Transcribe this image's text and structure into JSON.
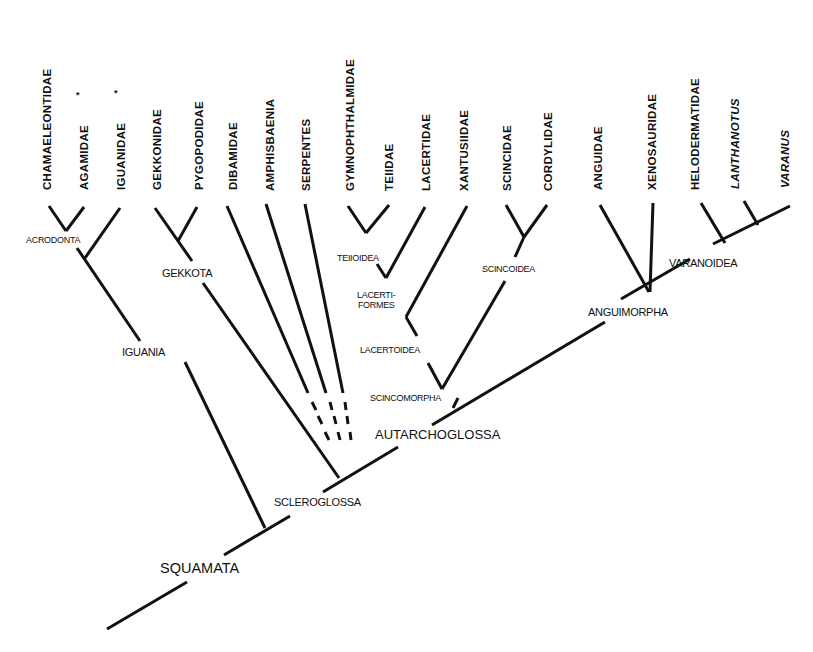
{
  "diagram": {
    "type": "cladogram",
    "root": "SQUAMATA",
    "taxa": [
      {
        "id": "chamaeleontidae",
        "label": "CHAMAELEONTIDAE",
        "x": 52,
        "italic": false,
        "marked": false
      },
      {
        "id": "agamidae",
        "label": "AGAMIDAE",
        "x": 89,
        "italic": false,
        "marked": true
      },
      {
        "id": "iguanidae",
        "label": "IGUANIDAE",
        "x": 125,
        "italic": false,
        "marked": true
      },
      {
        "id": "gekkonidae",
        "label": "GEKKONIDAE",
        "x": 162,
        "italic": false,
        "marked": false
      },
      {
        "id": "pygopodidae",
        "label": "PYGOPODIDAE",
        "x": 205,
        "italic": false,
        "marked": false
      },
      {
        "id": "dibamidae",
        "label": "DIBAMIDAE",
        "x": 238,
        "italic": false,
        "marked": false
      },
      {
        "id": "amphisbaenia",
        "label": "AMPHISBAENIA",
        "x": 277,
        "italic": false,
        "marked": false
      },
      {
        "id": "serpentes",
        "label": "SERPENTES",
        "x": 314,
        "italic": false,
        "marked": false
      },
      {
        "id": "gymnophthalmidae",
        "label": "GYMNOPHTHALMIDAE",
        "x": 358,
        "italic": false,
        "marked": false
      },
      {
        "id": "teiidae",
        "label": "TEIIDAE",
        "x": 396,
        "italic": false,
        "marked": false
      },
      {
        "id": "lacertidae",
        "label": "LACERTIDAE",
        "x": 432,
        "italic": false,
        "marked": false
      },
      {
        "id": "xantusiidae",
        "label": "XANTUSIIDAE",
        "x": 469,
        "italic": false,
        "marked": false
      },
      {
        "id": "scincidae",
        "label": "SCINCIDAE",
        "x": 512,
        "italic": false,
        "marked": false
      },
      {
        "id": "cordylidae",
        "label": "CORDYLIDAE",
        "x": 550,
        "italic": false,
        "marked": false
      },
      {
        "id": "anguidae",
        "label": "ANGUIDAE",
        "x": 599,
        "italic": false,
        "marked": false
      },
      {
        "id": "xenosauridae",
        "label": "XENOSAURIDAE",
        "x": 653,
        "italic": false,
        "marked": false
      },
      {
        "id": "helodermatidae",
        "label": "HELODERMATIDAE",
        "x": 695,
        "italic": false,
        "marked": false
      },
      {
        "id": "lanthanotus",
        "label": "LANTHANOTUS",
        "x": 734,
        "italic": true,
        "marked": false
      },
      {
        "id": "varanus",
        "label": "VARANUS",
        "x": 782,
        "italic": true,
        "marked": false
      }
    ],
    "marker_symbol": "*",
    "clades": [
      {
        "id": "acrodonta",
        "label": "ACRODONTA"
      },
      {
        "id": "iguania",
        "label": "IGUANIA"
      },
      {
        "id": "gekkota",
        "label": "GEKKOTA"
      },
      {
        "id": "teiioidea",
        "label": "TEIIOIDEA"
      },
      {
        "id": "lacertiformes",
        "label": "LACERTI-\nFORMES",
        "line1": "LACERTI-",
        "line2": "FORMES"
      },
      {
        "id": "lacertoidea",
        "label": "LACERTOIDEA"
      },
      {
        "id": "scincoidea",
        "label": "SCINCOIDEA"
      },
      {
        "id": "scincomorpha",
        "label": "SCINCOMORPHA"
      },
      {
        "id": "autarchoglossa",
        "label": "AUTARCHOGLOSSA"
      },
      {
        "id": "anguimorpha",
        "label": "ANGUIMORPHA"
      },
      {
        "id": "varanoidea",
        "label": "VARANOIDEA"
      },
      {
        "id": "scleroglossa",
        "label": "SCLEROGLOSSA"
      },
      {
        "id": "squamata",
        "label": "SQUAMATA"
      }
    ]
  }
}
